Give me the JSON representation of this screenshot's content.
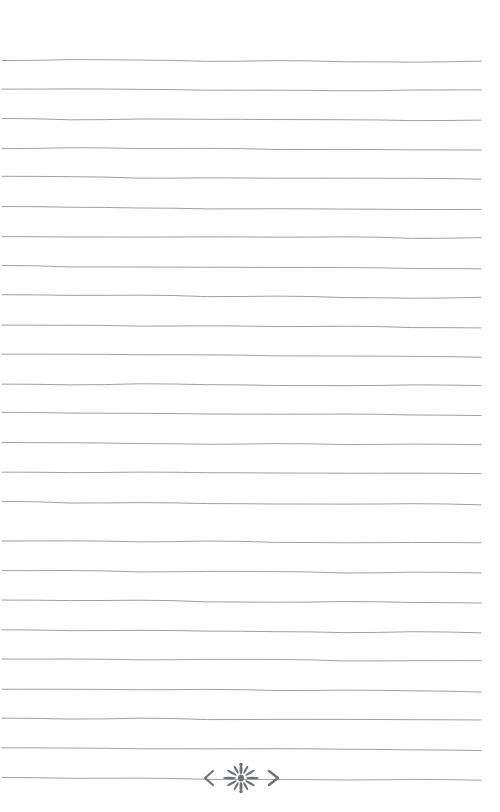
{
  "page": {
    "title": "Lined Journal Page",
    "kind": "ruled-notebook-page",
    "width": 500,
    "height": 812,
    "background_color": "#ffffff",
    "paper_style": "blank ruled stationery",
    "visible_text": ""
  },
  "rules": {
    "name": "ruled-lines",
    "count": 24,
    "color": "#8b8f93",
    "stroke_width": 0.85,
    "style": "hand-drawn, slightly wavy, faint downward slope to the right",
    "left_x": 2,
    "right_x": 481,
    "first_line_y": 60,
    "spacing": 29.5,
    "line_y_positions": [
      60,
      89,
      119,
      148,
      177,
      207,
      236,
      266,
      295,
      325,
      354,
      384,
      413,
      443,
      472,
      502,
      541,
      571,
      600,
      630,
      659,
      689,
      718,
      748,
      778
    ]
  },
  "ornament": {
    "name": "floral-divider-ornament",
    "description": "centered flourish with left and right chevron arrows flanking a radiating petal rosette",
    "color": "#6e7377",
    "center_x": 241,
    "center_y": 778,
    "span_left_x": 196,
    "span_right_x": 288,
    "glyph": "❮ ❊ ❯",
    "on_line_index": 24,
    "parts": {
      "left_arrow": "chevron-left",
      "right_arrow": "chevron-right",
      "center": "petal-rosette"
    }
  },
  "accessibility": {
    "page_role": "decorative ruled writing surface",
    "writing_area_label": "Writing lines"
  }
}
